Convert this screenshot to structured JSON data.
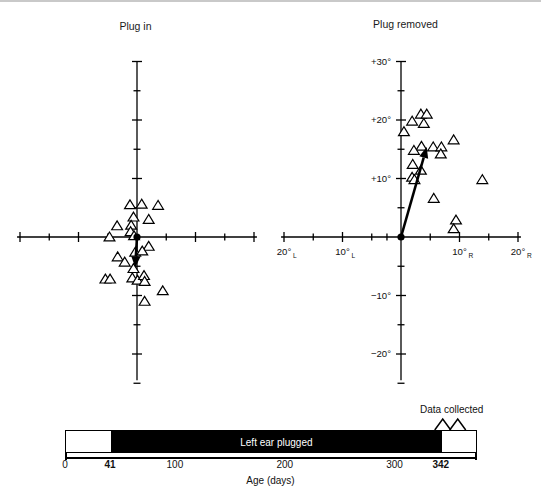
{
  "figure": {
    "background": "#ffffff",
    "marker_color": "#000000"
  },
  "panels": [
    {
      "id": "plug-in",
      "title": "Plug in",
      "x_axis": {
        "labels_shown": false,
        "tick_count": 9,
        "tick_interval_deg": 5,
        "range_deg": [
          -20,
          20
        ]
      },
      "y_axis": {
        "labels_shown": false,
        "tick_interval_deg": 5,
        "range_deg": [
          -25,
          30
        ]
      }
    },
    {
      "id": "plug-removed",
      "title": "Plug removed",
      "x_axis": {
        "labels_shown": true,
        "tick_interval_deg": 5,
        "range_deg": [
          -20,
          20
        ],
        "tick_labels": [
          {
            "value": -20,
            "text": "20°",
            "sub": "L"
          },
          {
            "value": -10,
            "text": "10°",
            "sub": "L"
          },
          {
            "value": 10,
            "text": "10°",
            "sub": "R"
          },
          {
            "value": 20,
            "text": "20°",
            "sub": "R"
          }
        ]
      },
      "y_axis": {
        "labels_shown": true,
        "tick_interval_deg": 5,
        "range_deg": [
          -25,
          30
        ],
        "tick_labels": [
          {
            "value": 30,
            "text": "+30°"
          },
          {
            "value": 20,
            "text": "+20°"
          },
          {
            "value": 10,
            "text": "+10°"
          },
          {
            "value": -10,
            "text": "−10°"
          },
          {
            "value": -20,
            "text": "−20°"
          }
        ]
      }
    }
  ],
  "chart_data": [
    {
      "type": "scatter",
      "id": "plug-in",
      "title": "Plug in",
      "xlabel": "",
      "ylabel": "",
      "xlim": [
        -20,
        20
      ],
      "ylim": [
        -25,
        30
      ],
      "grid": false,
      "legend": "none",
      "marker": "open-triangle",
      "points": [
        [
          -1.2,
          5.5
        ],
        [
          0.8,
          5.6
        ],
        [
          3.6,
          5.4
        ],
        [
          -0.6,
          3.4
        ],
        [
          2.0,
          3.0
        ],
        [
          -3.4,
          1.9
        ],
        [
          -1.0,
          2.0
        ],
        [
          -1.1,
          0.9
        ],
        [
          -4.7,
          0.0
        ],
        [
          -0.5,
          0.2
        ],
        [
          2.0,
          -1.6
        ],
        [
          -0.3,
          -2.6
        ],
        [
          0.9,
          -2.4
        ],
        [
          -3.3,
          -3.4
        ],
        [
          -2.1,
          -4.3
        ],
        [
          -0.6,
          -5.4
        ],
        [
          -5.4,
          -7.2
        ],
        [
          -4.6,
          -7.2
        ],
        [
          -0.8,
          -7.0
        ],
        [
          0.1,
          -7.4
        ],
        [
          1.2,
          -6.6
        ],
        [
          1.3,
          -7.6
        ],
        [
          4.4,
          -9.2
        ],
        [
          1.3,
          -11.0
        ]
      ],
      "mean_vector": {
        "from": [
          0,
          0
        ],
        "to": [
          -0.3,
          -5.2
        ],
        "style": "arrow"
      },
      "origin_marker": "filled-circle"
    },
    {
      "type": "scatter",
      "id": "plug-removed",
      "title": "Plug removed",
      "xlabel": "",
      "ylabel": "",
      "xlim": [
        -20,
        20
      ],
      "ylim": [
        -25,
        30
      ],
      "grid": false,
      "legend": "none",
      "marker": "open-triangle",
      "points": [
        [
          3.4,
          21.0
        ],
        [
          4.4,
          21.0
        ],
        [
          1.9,
          19.8
        ],
        [
          3.9,
          19.4
        ],
        [
          0.5,
          18.0
        ],
        [
          9.0,
          16.6
        ],
        [
          3.5,
          15.5
        ],
        [
          5.5,
          15.4
        ],
        [
          6.9,
          15.4
        ],
        [
          2.2,
          14.8
        ],
        [
          6.8,
          14.2
        ],
        [
          2.0,
          12.4
        ],
        [
          3.4,
          11.4
        ],
        [
          1.9,
          10.2
        ],
        [
          2.3,
          9.8
        ],
        [
          13.9,
          9.8
        ],
        [
          5.6,
          6.6
        ],
        [
          9.4,
          2.9
        ],
        [
          9.0,
          1.4
        ]
      ],
      "mean_vector": {
        "from": [
          0,
          0
        ],
        "to": [
          4.4,
          15.4
        ],
        "style": "arrow"
      },
      "origin_marker": "filled-circle"
    }
  ],
  "timeline": {
    "bar_label": "Left ear plugged",
    "plug_start_day": 41,
    "plug_end_day": 342,
    "axis_min_day": 0,
    "axis_max_day": 375,
    "axis_title": "Age (days)",
    "annotation": {
      "text": "Data collected",
      "at_day": 352
    },
    "ticks": [
      {
        "value": 0,
        "label": "0",
        "bold": false
      },
      {
        "value": 41,
        "label": "41",
        "bold": true
      },
      {
        "value": 100,
        "label": "100",
        "bold": false
      },
      {
        "value": 200,
        "label": "200",
        "bold": false
      },
      {
        "value": 300,
        "label": "300",
        "bold": false
      },
      {
        "value": 342,
        "label": "342",
        "bold": true
      }
    ]
  }
}
